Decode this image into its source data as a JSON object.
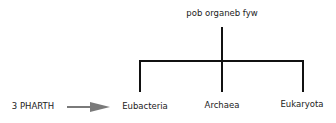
{
  "diagram": {
    "root": {
      "label": "pob organeb fyw"
    },
    "children": [
      {
        "label": "Eubacteria"
      },
      {
        "label": "Archaea"
      },
      {
        "label": "Eukaryota"
      }
    ],
    "pointer": {
      "label": "3 PHARTH",
      "target": "Eubacteria",
      "arrow_color": "#7a7a7a"
    },
    "line_color": "#111111"
  }
}
